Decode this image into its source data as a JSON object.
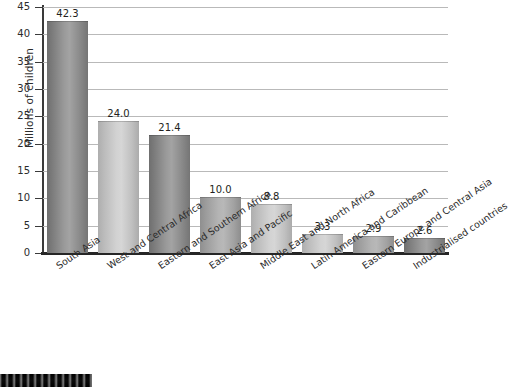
{
  "chart_data": {
    "type": "bar",
    "title": "",
    "xlabel": "",
    "ylabel": "Millions of children",
    "ylim": [
      0,
      45
    ],
    "yticks": [
      0,
      5,
      10,
      15,
      20,
      25,
      30,
      35,
      40,
      45
    ],
    "grid": true,
    "legend": "none",
    "categories": [
      "South Asia",
      "West and Central Africa",
      "Eastern and Southern Africa",
      "East Asia and Pacific",
      "Middle East and North Africa",
      "Latin America and Caribbean",
      "Eastern Europe and Central Asia",
      "Industrialised countries"
    ],
    "values": [
      42.3,
      24.0,
      21.4,
      10.0,
      8.8,
      3.3,
      2.9,
      2.6
    ],
    "value_labels": [
      "42.3",
      "24.0",
      "21.4",
      "10.0",
      "8.8",
      "3.3",
      "2.9",
      "2.6"
    ],
    "bar_shades": [
      "dark",
      "light",
      "dark",
      "mid",
      "light",
      "light",
      "mid",
      "dark"
    ],
    "colors": {
      "bar_dark": "#8a8a8a",
      "bar_light": "#c6c6c6",
      "bar_mid": "#a8a8a8",
      "gridline": "#b9b9b9",
      "axis": "#2b2b2b",
      "text": "#231f20",
      "background": "#ffffff"
    }
  }
}
